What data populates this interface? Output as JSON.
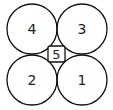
{
  "diagram": {
    "stroke_color": "#111111",
    "background": "#ffffff",
    "circles": [
      {
        "label": "4",
        "cx": 32,
        "cy": 29,
        "r": 25
      },
      {
        "label": "3",
        "cx": 82,
        "cy": 29,
        "r": 25
      },
      {
        "label": "2",
        "cx": 32,
        "cy": 80,
        "r": 25
      },
      {
        "label": "1",
        "cx": 82,
        "cy": 80,
        "r": 25
      }
    ],
    "center_box": {
      "label": "5",
      "x": 48,
      "y": 46,
      "w": 17,
      "h": 16
    }
  }
}
